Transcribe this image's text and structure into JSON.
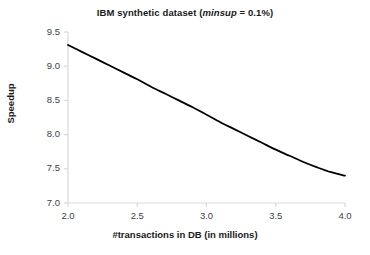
{
  "chart_data": {
    "type": "line",
    "title": "IBM synthetic dataset (minsup = 0.1%)",
    "title_prefix": "IBM synthetic dataset (",
    "title_italic": "minsup",
    "title_suffix": " = 0.1%)",
    "xlabel": "#transactions in DB (in millions)",
    "ylabel": "Speedup",
    "xlim": [
      2.0,
      4.0
    ],
    "ylim": [
      7.0,
      9.5
    ],
    "xticks": [
      "2.0",
      "2.5",
      "3.0",
      "3.5",
      "4.0"
    ],
    "xtick_values": [
      2.0,
      2.5,
      3.0,
      3.5,
      4.0
    ],
    "yticks": [
      "7.0",
      "7.5",
      "8.0",
      "8.5",
      "9.0",
      "9.5"
    ],
    "ytick_values": [
      7.0,
      7.5,
      8.0,
      8.5,
      9.0,
      9.5
    ],
    "grid": false,
    "legend": false,
    "line_color": "#000000",
    "line_width": 1.8,
    "axis_color": "#d9d9d9",
    "background": "#ffffff",
    "series": [
      {
        "name": "Speedup",
        "x": [
          2.0,
          2.1,
          2.2,
          2.3,
          2.4,
          2.5,
          2.6,
          2.7,
          2.8,
          2.9,
          3.0,
          3.1,
          3.2,
          3.3,
          3.4,
          3.5,
          3.6,
          3.7,
          3.8,
          3.9,
          4.0
        ],
        "values": [
          9.31,
          9.21,
          9.11,
          9.01,
          8.91,
          8.81,
          8.7,
          8.6,
          8.5,
          8.4,
          8.29,
          8.18,
          8.08,
          7.98,
          7.88,
          7.78,
          7.69,
          7.6,
          7.52,
          7.45,
          7.4
        ]
      }
    ]
  }
}
